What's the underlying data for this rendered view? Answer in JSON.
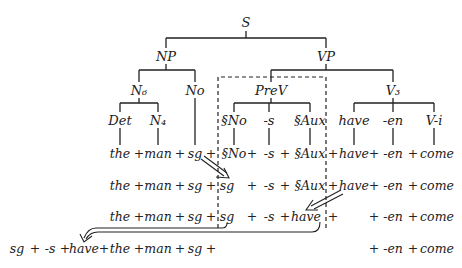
{
  "tree": {
    "nodes": [
      {
        "id": "S",
        "label": "S",
        "x": 246,
        "y": 22
      },
      {
        "id": "NP",
        "label": "NP",
        "x": 166,
        "y": 56
      },
      {
        "id": "VP",
        "label": "VP",
        "x": 326,
        "y": 56
      },
      {
        "id": "N6",
        "label": "N₆",
        "x": 139,
        "y": 90
      },
      {
        "id": "No",
        "label": "No",
        "x": 195,
        "y": 90
      },
      {
        "id": "PreV",
        "label": "PreV",
        "x": 271,
        "y": 90
      },
      {
        "id": "V3",
        "label": "V₃",
        "x": 393,
        "y": 90
      },
      {
        "id": "Det",
        "label": "Det",
        "x": 120,
        "y": 120
      },
      {
        "id": "N4",
        "label": "N₄",
        "x": 158,
        "y": 120
      },
      {
        "id": "sNo",
        "label": "§No",
        "x": 234,
        "y": 120
      },
      {
        "id": "s",
        "label": "-s",
        "x": 269,
        "y": 120
      },
      {
        "id": "sAux",
        "label": "§Aux",
        "x": 310,
        "y": 120
      },
      {
        "id": "have",
        "label": "have",
        "x": 354,
        "y": 120
      },
      {
        "id": "en",
        "label": "-en",
        "x": 393,
        "y": 120
      },
      {
        "id": "Vi",
        "label": "V-i",
        "x": 434,
        "y": 120
      }
    ]
  },
  "rows": [
    {
      "y": 153,
      "tokens": [
        {
          "t": "the",
          "x": 120
        },
        {
          "t": "+",
          "x": 139
        },
        {
          "t": "man",
          "x": 158
        },
        {
          "t": "+",
          "x": 180
        },
        {
          "t": "sg",
          "x": 195
        },
        {
          "t": "+",
          "x": 211
        },
        {
          "t": "§No",
          "x": 234
        },
        {
          "t": "+",
          "x": 252
        },
        {
          "t": "-s",
          "x": 269
        },
        {
          "t": "+",
          "x": 285
        },
        {
          "t": "§Aux",
          "x": 310
        },
        {
          "t": "+",
          "x": 333
        },
        {
          "t": "have",
          "x": 354
        },
        {
          "t": "+",
          "x": 374
        },
        {
          "t": "-en",
          "x": 393
        },
        {
          "t": "+",
          "x": 413
        },
        {
          "t": "come",
          "x": 437
        }
      ]
    },
    {
      "y": 185,
      "tokens": [
        {
          "t": "the",
          "x": 120
        },
        {
          "t": "+",
          "x": 139
        },
        {
          "t": "man",
          "x": 158
        },
        {
          "t": "+",
          "x": 180
        },
        {
          "t": "sg",
          "x": 195
        },
        {
          "t": "+",
          "x": 211
        },
        {
          "t": "sg",
          "x": 227
        },
        {
          "t": "+",
          "x": 252
        },
        {
          "t": "-s",
          "x": 269
        },
        {
          "t": "+",
          "x": 285
        },
        {
          "t": "§Aux",
          "x": 310
        },
        {
          "t": "+",
          "x": 333
        },
        {
          "t": "have",
          "x": 354
        },
        {
          "t": "+",
          "x": 374
        },
        {
          "t": "-en",
          "x": 393
        },
        {
          "t": "+",
          "x": 413
        },
        {
          "t": "come",
          "x": 437
        }
      ]
    },
    {
      "y": 216,
      "tokens": [
        {
          "t": "the",
          "x": 120
        },
        {
          "t": "+",
          "x": 139
        },
        {
          "t": "man",
          "x": 158
        },
        {
          "t": "+",
          "x": 180
        },
        {
          "t": "sg",
          "x": 195
        },
        {
          "t": "+",
          "x": 211
        },
        {
          "t": "sg",
          "x": 227
        },
        {
          "t": "+",
          "x": 252
        },
        {
          "t": "-s",
          "x": 269
        },
        {
          "t": "+",
          "x": 285
        },
        {
          "t": "have",
          "x": 306
        },
        {
          "t": "+",
          "x": 333
        },
        {
          "t": "+",
          "x": 374
        },
        {
          "t": "-en",
          "x": 393
        },
        {
          "t": "+",
          "x": 413
        },
        {
          "t": "come",
          "x": 437
        }
      ]
    },
    {
      "y": 248,
      "tokens": [
        {
          "t": "sg",
          "x": 17
        },
        {
          "t": "+",
          "x": 35
        },
        {
          "t": "-s",
          "x": 50
        },
        {
          "t": "+",
          "x": 65
        },
        {
          "t": "have",
          "x": 84
        },
        {
          "t": "+",
          "x": 104
        },
        {
          "t": "the",
          "x": 120
        },
        {
          "t": "+",
          "x": 139
        },
        {
          "t": "man",
          "x": 158
        },
        {
          "t": "+",
          "x": 180
        },
        {
          "t": "sg",
          "x": 195
        },
        {
          "t": "+",
          "x": 211
        },
        {
          "t": "+",
          "x": 374
        },
        {
          "t": "-en",
          "x": 393
        },
        {
          "t": "+",
          "x": 413
        },
        {
          "t": "come",
          "x": 437
        }
      ]
    }
  ]
}
